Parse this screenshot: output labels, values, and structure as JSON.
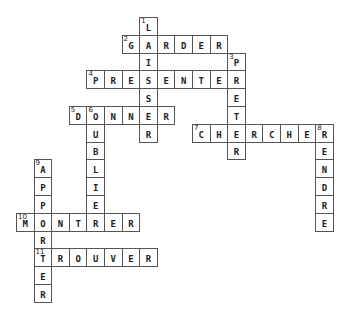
{
  "puzzle": {
    "type": "crossword",
    "cell_w": 17.6,
    "cell_h": 17.8,
    "origin_x": 16,
    "origin_y": 17,
    "words": [
      {
        "number": "1",
        "answer": "LAISSER",
        "direction": "down",
        "row": 0,
        "col": 7
      },
      {
        "number": "2",
        "answer": "GARDER",
        "direction": "across",
        "row": 1,
        "col": 6
      },
      {
        "number": "3",
        "answer": "PRETER",
        "direction": "down",
        "row": 2,
        "col": 12
      },
      {
        "number": "4",
        "answer": "PRESENTER",
        "direction": "across",
        "row": 3,
        "col": 4
      },
      {
        "number": "5",
        "answer": "DONNER",
        "direction": "across",
        "row": 5,
        "col": 3
      },
      {
        "number": "6",
        "answer": "OUBLIER",
        "direction": "down",
        "row": 5,
        "col": 4
      },
      {
        "number": "7",
        "answer": "CHERCHER",
        "direction": "across",
        "row": 6,
        "col": 10
      },
      {
        "number": "8",
        "answer": "RENDRE",
        "direction": "down",
        "row": 6,
        "col": 17
      },
      {
        "number": "9",
        "answer": "APPORTER",
        "direction": "down",
        "row": 8,
        "col": 1
      },
      {
        "number": "10",
        "answer": "MONTRER",
        "direction": "across",
        "row": 11,
        "col": 0
      },
      {
        "number": "11",
        "answer": "TROUVER",
        "direction": "across",
        "row": 13,
        "col": 1
      }
    ]
  },
  "colors": {
    "border": "#555555",
    "letter": "#222222",
    "background": "#ffffff"
  }
}
